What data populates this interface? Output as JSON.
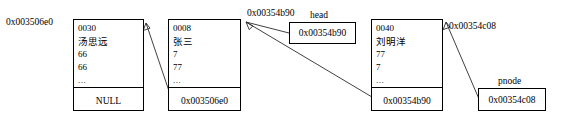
{
  "diagram": {
    "nodes": [
      {
        "address_label": "0x003506e0",
        "fields": [
          "0030",
          "汤思远",
          "66",
          "66",
          "..."
        ],
        "pointer": "NULL"
      },
      {
        "address_label": "",
        "fields": [
          "0008",
          "张三",
          "7",
          "77",
          "..."
        ],
        "pointer": "0x003506e0"
      },
      {
        "address_label": "",
        "fields": [
          "0040",
          "刘明洋",
          "77",
          "7",
          "..."
        ],
        "pointer": "0x00354b90"
      }
    ],
    "labels": {
      "node3_address": "0x00354b90",
      "pnode_address": "0x00354c08"
    },
    "variables": [
      {
        "name": "head",
        "value": "0x00354b90"
      },
      {
        "name": "pnode",
        "value": "0x00354c08"
      }
    ]
  }
}
